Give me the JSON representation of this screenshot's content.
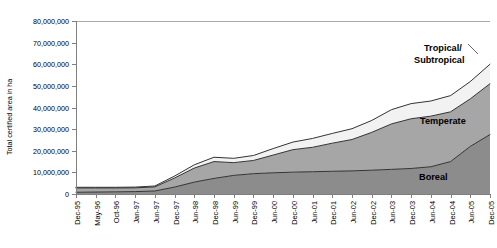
{
  "chart_data": {
    "type": "area",
    "stacked": true,
    "title": "",
    "xlabel": "",
    "ylabel": "Total certified area in ha",
    "ylim": [
      0,
      80000000
    ],
    "ytick_values": [
      0,
      10000000,
      20000000,
      30000000,
      40000000,
      50000000,
      60000000,
      70000000,
      80000000
    ],
    "ytick_labels": [
      "0",
      "10,000,000",
      "20,000,000",
      "30,000,000",
      "40,000,000",
      "50,000,000",
      "60,000,000",
      "70,000,000",
      "80,000,000"
    ],
    "grid": false,
    "legend_position": "inline-right",
    "categories": [
      "Dec-95",
      "May-96",
      "Oct-96",
      "Jan-97",
      "Jun-97",
      "Dec-97",
      "Jun-98",
      "Dec-98",
      "Jun-99",
      "Dec-99",
      "Jun-00",
      "Dec-00",
      "Jun-01",
      "Dec-01",
      "Jun-02",
      "Dec-02",
      "Jun-03",
      "Dec-03",
      "Jun-04",
      "Dec-04",
      "Jun-05",
      "Dec-05"
    ],
    "series": [
      {
        "name": "Boreal",
        "color": "#8c8c8c",
        "values": [
          800000,
          900000,
          1000000,
          1100000,
          1400000,
          3200000,
          5500000,
          7200000,
          8600000,
          9400000,
          9800000,
          10100000,
          10300000,
          10500000,
          10700000,
          11000000,
          11400000,
          11800000,
          12600000,
          15000000,
          22000000,
          27500000
        ]
      },
      {
        "name": "Temperate",
        "color": "#a6a6a6",
        "values": [
          2000000,
          1900000,
          1800000,
          1750000,
          1900000,
          4200000,
          6500000,
          7800000,
          5900000,
          6100000,
          8200000,
          10400000,
          11300000,
          13000000,
          14500000,
          17500000,
          21000000,
          23000000,
          23400000,
          23000000,
          22000000,
          23500000
        ]
      },
      {
        "name": "Tropical/Subtropical",
        "color": "#f2f2f2",
        "values": [
          300000,
          300000,
          300000,
          350000,
          400000,
          900000,
          1500000,
          2000000,
          2000000,
          2300000,
          3000000,
          3500000,
          4100000,
          4500000,
          5000000,
          5500000,
          6600000,
          7000000,
          7000000,
          7500000,
          8000000,
          9000000
        ]
      }
    ],
    "series_label_annotations": [
      {
        "name": "tropical-subtropical",
        "line1": "Tropical/",
        "line2": "Subtropical"
      },
      {
        "name": "temperate",
        "line1": "Temperate",
        "line2": ""
      },
      {
        "name": "boreal",
        "line1": "Boreal",
        "line2": ""
      }
    ]
  }
}
